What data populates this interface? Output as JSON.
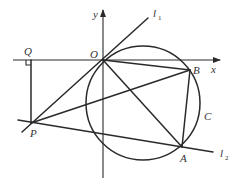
{
  "diagram": {
    "type": "geometry",
    "labels": {
      "x_axis": "x",
      "y_axis": "y",
      "origin": "O",
      "point_A": "A",
      "point_B": "B",
      "point_P": "P",
      "point_Q": "Q",
      "circle": "C",
      "line1": "l",
      "line1_sub": "1",
      "line2": "l",
      "line2_sub": "2"
    },
    "segments": [
      "OB",
      "OA",
      "AB",
      "PB",
      "PQ"
    ],
    "lines": [
      "l1 (through P and O)",
      "l2 (through P and A)"
    ],
    "right_angle_at": "Q",
    "colors": {
      "stroke": "#2a2a2a",
      "text": "#333333",
      "background": "#ffffff"
    }
  }
}
